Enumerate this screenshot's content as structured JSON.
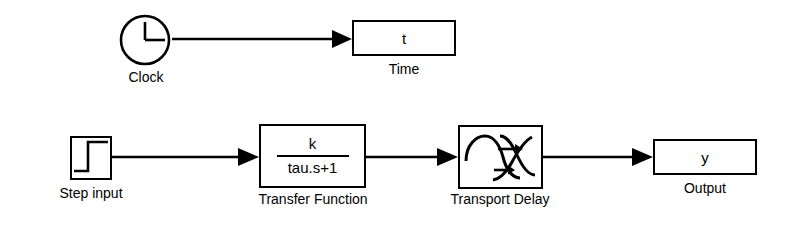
{
  "diagram": {
    "background_color": "#ffffff",
    "line_color": "#000000",
    "blocks": [
      {
        "id": "clock",
        "type": "source",
        "icon": "clock-icon",
        "caption": "Clock",
        "value": ""
      },
      {
        "id": "time",
        "type": "display",
        "icon": "display-box",
        "caption": "Time",
        "value": "t"
      },
      {
        "id": "step_input",
        "type": "source",
        "icon": "step-icon",
        "caption": "Step  input",
        "value": ""
      },
      {
        "id": "transfer_function",
        "type": "transfer-function",
        "icon": "fraction",
        "caption": "Transfer Function",
        "numerator": "k",
        "denominator": "tau.s+1"
      },
      {
        "id": "transport_delay",
        "type": "delay",
        "icon": "transport-delay-icon",
        "caption": "Transport Delay",
        "value": ""
      },
      {
        "id": "output",
        "type": "display",
        "icon": "display-box",
        "caption": "Output",
        "value": "y"
      }
    ],
    "connections": [
      {
        "id": "clock-to-time",
        "from": "clock",
        "to": "time"
      },
      {
        "id": "step-to-tf",
        "from": "step_input",
        "to": "transfer_function"
      },
      {
        "id": "tf-to-delay",
        "from": "transfer_function",
        "to": "transport_delay"
      },
      {
        "id": "delay-to-output",
        "from": "transport_delay",
        "to": "output"
      }
    ]
  }
}
